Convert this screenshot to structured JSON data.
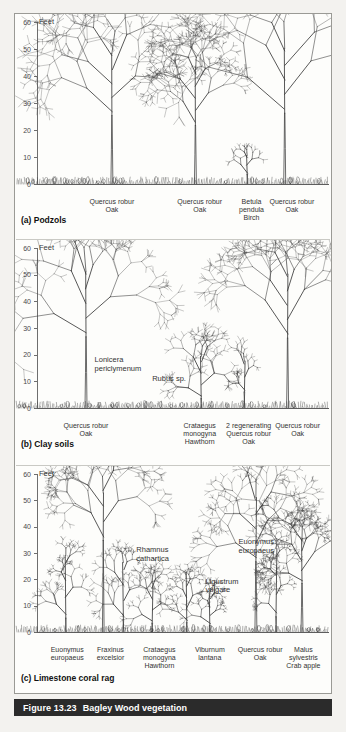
{
  "figure": {
    "number": "Figure 13.23",
    "title": "Bagley Wood vegetation",
    "axis_unit": "Feet",
    "y_ticks": [
      0,
      10,
      20,
      30,
      40,
      50,
      60
    ],
    "y_min": 0,
    "y_max": 60
  },
  "chart_data": {
    "type": "diagram",
    "title": "Bagley Wood vegetation",
    "ylabel": "Feet",
    "ylim": [
      0,
      60
    ],
    "yticks": [
      0,
      10,
      20,
      30,
      40,
      50,
      60
    ],
    "grid": false,
    "legend": "none",
    "panels": [
      {
        "key": "podzols",
        "title": "(a) Podzols",
        "plants": [
          {
            "name": "Quercus robur",
            "common": "Oak",
            "height": 55,
            "x": 0.26,
            "crown": 0.3,
            "kind": "oak"
          },
          {
            "name": "Quercus robur",
            "common": "Oak",
            "height": 47,
            "x": 0.55,
            "crown": 0.2,
            "kind": "oak"
          },
          {
            "name": "Betula pendula",
            "common": "Birch",
            "height": 12,
            "x": 0.73,
            "crown": 0.08,
            "kind": "sapling"
          },
          {
            "name": "Quercus robur",
            "common": "Oak",
            "height": 57,
            "x": 0.86,
            "crown": 0.36,
            "kind": "oak"
          }
        ],
        "bottom_labels": [
          {
            "text": "Quercus robur\nOak",
            "x": 0.26
          },
          {
            "text": "Quercus robur\nOak",
            "x": 0.565
          },
          {
            "text": "Betula\npendula\nBirch",
            "x": 0.745
          },
          {
            "text": "Quercus robur\nOak",
            "x": 0.885
          }
        ],
        "annotations": []
      },
      {
        "key": "clay",
        "title": "(b) Clay soils",
        "plants": [
          {
            "name": "Quercus robur",
            "common": "Oak",
            "height": 58,
            "x": 0.17,
            "crown": 0.33,
            "kind": "oak"
          },
          {
            "name": "Crataegus monogyna",
            "common": "Hawthorn",
            "height": 22,
            "x": 0.57,
            "crown": 0.14,
            "kind": "shrub"
          },
          {
            "name": "2 regenerating Quercus robur",
            "common": "Oak",
            "height": 20,
            "x": 0.72,
            "crown": 0.1,
            "kind": "sapling"
          },
          {
            "name": "Quercus robur",
            "common": "Oak",
            "height": 57,
            "x": 0.87,
            "crown": 0.3,
            "kind": "oak"
          }
        ],
        "bottom_labels": [
          {
            "text": "Quercus robur\nOak",
            "x": 0.17
          },
          {
            "text": "Crataegus\nmonogyna\nHawthorn",
            "x": 0.565
          },
          {
            "text": "2 regenerating\nQuercus robur\nOak",
            "x": 0.735
          },
          {
            "text": "Quercus robur\nOak",
            "x": 0.905
          }
        ],
        "annotations": [
          {
            "text": "Lonicera\npericlymenum",
            "x": 0.2,
            "y": 18
          },
          {
            "text": "Rubus sp.",
            "x": 0.4,
            "y": 11
          }
        ]
      },
      {
        "key": "limestone",
        "title": "(c) Limestone coral rag",
        "plants": [
          {
            "name": "Euonymus europaeus",
            "common": "",
            "height": 33,
            "x": 0.1,
            "crown": 0.1,
            "kind": "shrub"
          },
          {
            "name": "Fraxinus excelsior",
            "common": "",
            "height": 60,
            "x": 0.23,
            "crown": 0.22,
            "kind": "ash"
          },
          {
            "name": "Rhamnus cathartica",
            "common": "",
            "height": 30,
            "x": 0.3,
            "crown": 0.12,
            "kind": "shrub"
          },
          {
            "name": "Crataegus monogyna",
            "common": "Hawthorn",
            "height": 21,
            "x": 0.4,
            "crown": 0.1,
            "kind": "shrub"
          },
          {
            "name": "Viburnum lantana",
            "common": "",
            "height": 22,
            "x": 0.52,
            "crown": 0.11,
            "kind": "shrub"
          },
          {
            "name": "Ligustrum vulgare",
            "common": "",
            "height": 16,
            "x": 0.6,
            "crown": 0.08,
            "kind": "shrub"
          },
          {
            "name": "Quercus robur",
            "common": "Oak",
            "height": 58,
            "x": 0.76,
            "crown": 0.24,
            "kind": "oak"
          },
          {
            "name": "Euonymus europaeus",
            "common": "",
            "height": 36,
            "x": 0.83,
            "crown": 0.1,
            "kind": "shrub"
          },
          {
            "name": "Malus sylvestris",
            "common": "Crab apple",
            "height": 40,
            "x": 0.92,
            "crown": 0.17,
            "kind": "oak"
          }
        ],
        "bottom_labels": [
          {
            "text": "Euonymus\neuropaeus",
            "x": 0.105
          },
          {
            "text": "Fraxinus\nexcelsior",
            "x": 0.255
          },
          {
            "text": "Crataegus\nmonogyna\nHawthorn",
            "x": 0.425
          },
          {
            "text": "Viburnum\nlantana",
            "x": 0.6
          },
          {
            "text": "Quercus robur\nOak",
            "x": 0.775
          },
          {
            "text": "Malus\nsylvestris\nCrab apple",
            "x": 0.925
          }
        ],
        "annotations": [
          {
            "text": "Rhamnus\ncathartica",
            "x": 0.345,
            "y": 31
          },
          {
            "text": "Ligustrum\nvulgare",
            "x": 0.585,
            "y": 19
          },
          {
            "text": "Euonymus\neuropaeus",
            "x": 0.7,
            "y": 34
          }
        ]
      }
    ]
  },
  "colors": {
    "ink": "#3a3a3a",
    "frame": "#9a9a95",
    "caption_bg": "#2b2b2b",
    "caption_fg": "#ffffff",
    "page_bg": "#f3f2ef",
    "plot_bg": "#fdfdfb"
  }
}
